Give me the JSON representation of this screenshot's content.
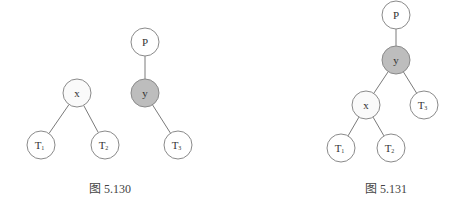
{
  "colors": {
    "node_fill_default": "#ffffff",
    "node_fill_highlight": "#bdbdbd",
    "node_fill_light": "#fafafa"
  },
  "figures": [
    {
      "id": "fig-5-130",
      "caption": "图 5.130",
      "description": "Two separate subtrees before rotation: x with children T1,T2; P with child y, y with right child T3",
      "nodes": [
        {
          "id": "x",
          "label": "x",
          "sub": "",
          "style": "light"
        },
        {
          "id": "T1",
          "label": "T",
          "sub": "1",
          "style": "default"
        },
        {
          "id": "T2",
          "label": "T",
          "sub": "2",
          "style": "default"
        },
        {
          "id": "P",
          "label": "P",
          "sub": "",
          "style": "default"
        },
        {
          "id": "y",
          "label": "y",
          "sub": "",
          "style": "highlight"
        },
        {
          "id": "T3",
          "label": "T",
          "sub": "3",
          "style": "default"
        }
      ],
      "edges": [
        [
          "x",
          "T1"
        ],
        [
          "x",
          "T2"
        ],
        [
          "P",
          "y"
        ],
        [
          "y",
          "T3"
        ]
      ]
    },
    {
      "id": "fig-5-131",
      "caption": "图 5.131",
      "description": "Combined tree: P -> y; y has left child x and right child T3; x has children T1, T2",
      "nodes": [
        {
          "id": "P",
          "label": "P",
          "sub": "",
          "style": "default"
        },
        {
          "id": "y",
          "label": "y",
          "sub": "",
          "style": "highlight"
        },
        {
          "id": "x",
          "label": "x",
          "sub": "",
          "style": "light"
        },
        {
          "id": "T3",
          "label": "T",
          "sub": "3",
          "style": "default"
        },
        {
          "id": "T1",
          "label": "T",
          "sub": "1",
          "style": "default"
        },
        {
          "id": "T2",
          "label": "T",
          "sub": "2",
          "style": "default"
        }
      ],
      "edges": [
        [
          "P",
          "y"
        ],
        [
          "y",
          "x"
        ],
        [
          "y",
          "T3"
        ],
        [
          "x",
          "T1"
        ],
        [
          "x",
          "T2"
        ]
      ]
    }
  ]
}
